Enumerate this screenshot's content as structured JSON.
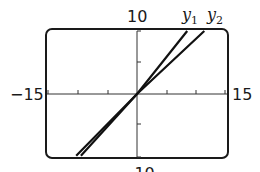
{
  "chart_data": {
    "type": "line",
    "title": "",
    "xlabel": "",
    "ylabel": "",
    "xlim": [
      -15,
      15
    ],
    "ylim": [
      -10,
      10
    ],
    "xscale_ticks": 5,
    "yscale_ticks": 5,
    "grid": false,
    "window_labels": {
      "xmin": "−15",
      "xmax": "15",
      "ymax": "10",
      "ymin": "−10"
    },
    "series": [
      {
        "name": "y1",
        "label_main": "y",
        "label_sub": "1",
        "points": [
          [
            -10.3,
            -9.8
          ],
          [
            0,
            0
          ],
          [
            8.5,
            10
          ]
        ]
      },
      {
        "name": "y2",
        "label_main": "y",
        "label_sub": "2",
        "points": [
          [
            -9.5,
            -9.8
          ],
          [
            0,
            0
          ],
          [
            11.4,
            10
          ]
        ]
      }
    ],
    "legend_position": "top-right, labels at line ends"
  }
}
